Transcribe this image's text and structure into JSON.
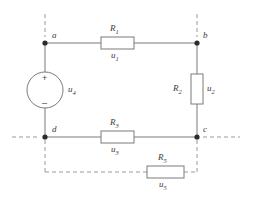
{
  "figure": {
    "type": "electrical-circuit-schematic",
    "background_color": "#ffffff",
    "wire_color": "#7a7a7a",
    "dashed_color": "#9a9a9a",
    "text_color": "#3a3a3a"
  },
  "nodes": [
    {
      "id": "a",
      "label": "a",
      "x": 45,
      "y": 43
    },
    {
      "id": "b",
      "label": "b",
      "x": 197,
      "y": 43
    },
    {
      "id": "c",
      "label": "c",
      "x": 197,
      "y": 137
    },
    {
      "id": "d",
      "label": "d",
      "x": 45,
      "y": 137
    }
  ],
  "components": [
    {
      "id": "R1",
      "kind": "resistor",
      "orientation": "horizontal",
      "name": "R",
      "name_sub": "1",
      "voltage": "u",
      "voltage_sub": "1",
      "branch": "a-b"
    },
    {
      "id": "R2",
      "kind": "resistor",
      "orientation": "vertical",
      "name": "R",
      "name_sub": "2",
      "voltage": "u",
      "voltage_sub": "2",
      "branch": "b-c"
    },
    {
      "id": "R3",
      "kind": "resistor",
      "orientation": "horizontal",
      "name": "R",
      "name_sub": "3",
      "voltage": "u",
      "voltage_sub": "3",
      "branch": "d-c"
    },
    {
      "id": "R5",
      "kind": "resistor",
      "orientation": "horizontal",
      "name": "R",
      "name_sub": "5",
      "voltage": "u",
      "voltage_sub": "5",
      "branch": "d-c-lower-dashed"
    },
    {
      "id": "U4",
      "kind": "voltage-source",
      "name": "u",
      "name_sub": "4",
      "plus_sign": "+",
      "minus_sign": "–",
      "branch": "a-d"
    }
  ],
  "labels": {
    "node_a": "a",
    "node_b": "b",
    "node_c": "c",
    "node_d": "d",
    "r1_name": "R",
    "r1_sub": "1",
    "u1_name": "u",
    "u1_sub": "1",
    "r2_name": "R",
    "r2_sub": "2",
    "u2_name": "u",
    "u2_sub": "2",
    "r3_name": "R",
    "r3_sub": "3",
    "u3_name": "u",
    "u3_sub": "3",
    "r5_name": "R",
    "r5_sub": "5",
    "u5_name": "u",
    "u5_sub": "5",
    "src_name": "u",
    "src_sub": "4",
    "plus": "+",
    "minus": "–"
  }
}
